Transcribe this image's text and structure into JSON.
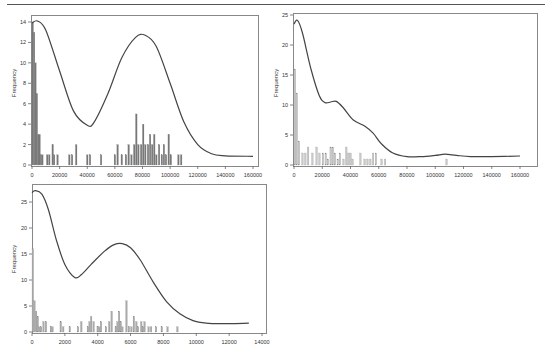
{
  "chart_data": [
    {
      "type": "bar",
      "overlay": "density-line",
      "title": "",
      "xlabel": "",
      "ylabel": "Frequency",
      "xlim": [
        0,
        160000
      ],
      "ylim": [
        0,
        14
      ],
      "xticks": [
        "0",
        "20000",
        "40000",
        "60000",
        "80000",
        "100000",
        "120000",
        "140000",
        "160000"
      ],
      "yticks": [
        "0",
        "2",
        "4",
        "6",
        "8",
        "10",
        "12",
        "14"
      ],
      "bar_color": "#777777",
      "bins": [
        {
          "x": 500,
          "h": 14
        },
        {
          "x": 1500,
          "h": 13
        },
        {
          "x": 2500,
          "h": 10
        },
        {
          "x": 3500,
          "h": 7
        },
        {
          "x": 4500,
          "h": 3
        },
        {
          "x": 5500,
          "h": 3
        },
        {
          "x": 6500,
          "h": 1
        },
        {
          "x": 7500,
          "h": 1
        },
        {
          "x": 11000,
          "h": 1
        },
        {
          "x": 12500,
          "h": 1
        },
        {
          "x": 15000,
          "h": 2
        },
        {
          "x": 16000,
          "h": 1
        },
        {
          "x": 18500,
          "h": 1
        },
        {
          "x": 27000,
          "h": 1
        },
        {
          "x": 29000,
          "h": 1
        },
        {
          "x": 32000,
          "h": 2
        },
        {
          "x": 40000,
          "h": 1
        },
        {
          "x": 42000,
          "h": 1
        },
        {
          "x": 50000,
          "h": 1
        },
        {
          "x": 60000,
          "h": 1
        },
        {
          "x": 62000,
          "h": 2
        },
        {
          "x": 65000,
          "h": 1
        },
        {
          "x": 68000,
          "h": 1
        },
        {
          "x": 70000,
          "h": 2
        },
        {
          "x": 72000,
          "h": 1
        },
        {
          "x": 74000,
          "h": 2
        },
        {
          "x": 75500,
          "h": 5
        },
        {
          "x": 77000,
          "h": 2
        },
        {
          "x": 79000,
          "h": 2
        },
        {
          "x": 80500,
          "h": 4
        },
        {
          "x": 82000,
          "h": 2
        },
        {
          "x": 84000,
          "h": 2
        },
        {
          "x": 85500,
          "h": 3
        },
        {
          "x": 87000,
          "h": 2
        },
        {
          "x": 88500,
          "h": 3
        },
        {
          "x": 90000,
          "h": 1
        },
        {
          "x": 92000,
          "h": 2
        },
        {
          "x": 94000,
          "h": 1
        },
        {
          "x": 95500,
          "h": 2
        },
        {
          "x": 97000,
          "h": 1
        },
        {
          "x": 99000,
          "h": 3
        },
        {
          "x": 100500,
          "h": 1
        },
        {
          "x": 106000,
          "h": 1
        },
        {
          "x": 108000,
          "h": 1
        }
      ],
      "curve": [
        [
          0,
          13.9
        ],
        [
          4000,
          14.1
        ],
        [
          10000,
          13.2
        ],
        [
          20000,
          9.2
        ],
        [
          30000,
          5.3
        ],
        [
          40000,
          3.9
        ],
        [
          45000,
          4.2
        ],
        [
          55000,
          7.0
        ],
        [
          65000,
          10.5
        ],
        [
          75000,
          12.5
        ],
        [
          82000,
          12.7
        ],
        [
          90000,
          11.6
        ],
        [
          100000,
          8.0
        ],
        [
          110000,
          4.2
        ],
        [
          120000,
          2.0
        ],
        [
          130000,
          1.1
        ],
        [
          140000,
          0.9
        ],
        [
          160000,
          0.85
        ]
      ]
    },
    {
      "type": "bar",
      "overlay": "density-line",
      "title": "",
      "xlabel": "",
      "ylabel": "Frequency",
      "xlim": [
        0,
        160000
      ],
      "ylim": [
        0,
        25
      ],
      "xticks": [
        "0",
        "20000",
        "40000",
        "60000",
        "80000",
        "100000",
        "120000",
        "140000",
        "160000"
      ],
      "yticks": [
        "0",
        "5",
        "10",
        "15",
        "20",
        "25"
      ],
      "bar_color": "#c8c8c8",
      "bins": [
        {
          "x": 700,
          "h": 16
        },
        {
          "x": 2000,
          "h": 12
        },
        {
          "x": 3500,
          "h": 4
        },
        {
          "x": 6000,
          "h": 2
        },
        {
          "x": 8000,
          "h": 2
        },
        {
          "x": 10000,
          "h": 3
        },
        {
          "x": 13000,
          "h": 2
        },
        {
          "x": 16000,
          "h": 3
        },
        {
          "x": 18000,
          "h": 2
        },
        {
          "x": 20500,
          "h": 2
        },
        {
          "x": 22500,
          "h": 2
        },
        {
          "x": 24000,
          "h": 1
        },
        {
          "x": 26000,
          "h": 3
        },
        {
          "x": 27500,
          "h": 3
        },
        {
          "x": 29000,
          "h": 2
        },
        {
          "x": 31000,
          "h": 1
        },
        {
          "x": 32500,
          "h": 2
        },
        {
          "x": 35000,
          "h": 1
        },
        {
          "x": 37000,
          "h": 3
        },
        {
          "x": 38500,
          "h": 2
        },
        {
          "x": 40000,
          "h": 2
        },
        {
          "x": 41500,
          "h": 1
        },
        {
          "x": 47000,
          "h": 2
        },
        {
          "x": 50000,
          "h": 1
        },
        {
          "x": 52000,
          "h": 1
        },
        {
          "x": 54000,
          "h": 1
        },
        {
          "x": 56000,
          "h": 2
        },
        {
          "x": 58000,
          "h": 2
        },
        {
          "x": 62000,
          "h": 1
        },
        {
          "x": 64500,
          "h": 1
        },
        {
          "x": 108000,
          "h": 1
        }
      ],
      "curve": [
        [
          0,
          23.5
        ],
        [
          2500,
          24.1
        ],
        [
          6000,
          22.0
        ],
        [
          12000,
          16.0
        ],
        [
          18000,
          11.5
        ],
        [
          22000,
          10.4
        ],
        [
          26000,
          10.5
        ],
        [
          30000,
          10.6
        ],
        [
          35000,
          9.5
        ],
        [
          42000,
          7.5
        ],
        [
          50000,
          6.5
        ],
        [
          56000,
          5.3
        ],
        [
          62000,
          3.5
        ],
        [
          70000,
          2.0
        ],
        [
          80000,
          1.4
        ],
        [
          90000,
          1.4
        ],
        [
          100000,
          1.6
        ],
        [
          107000,
          1.8
        ],
        [
          115000,
          1.6
        ],
        [
          125000,
          1.4
        ],
        [
          140000,
          1.4
        ],
        [
          160000,
          1.5
        ]
      ]
    },
    {
      "type": "bar",
      "overlay": "density-line",
      "title": "",
      "xlabel": "",
      "ylabel": "Frequency",
      "xlim": [
        0,
        14000
      ],
      "ylim": [
        0,
        27
      ],
      "xticks": [
        "0",
        "2000",
        "4000",
        "6000",
        "8000",
        "10000",
        "12000",
        "14000"
      ],
      "yticks": [
        "0",
        "5",
        "10",
        "15",
        "20",
        "25"
      ],
      "bar_color": "#aaaaaa",
      "bins": [
        {
          "x": 50,
          "h": 16
        },
        {
          "x": 150,
          "h": 6
        },
        {
          "x": 250,
          "h": 4
        },
        {
          "x": 350,
          "h": 3
        },
        {
          "x": 450,
          "h": 1
        },
        {
          "x": 550,
          "h": 1
        },
        {
          "x": 700,
          "h": 2
        },
        {
          "x": 850,
          "h": 2
        },
        {
          "x": 1150,
          "h": 1
        },
        {
          "x": 1250,
          "h": 1
        },
        {
          "x": 1750,
          "h": 2
        },
        {
          "x": 1900,
          "h": 1
        },
        {
          "x": 2300,
          "h": 1
        },
        {
          "x": 2800,
          "h": 1
        },
        {
          "x": 3000,
          "h": 2
        },
        {
          "x": 3400,
          "h": 1
        },
        {
          "x": 3500,
          "h": 2
        },
        {
          "x": 3600,
          "h": 3
        },
        {
          "x": 3750,
          "h": 2
        },
        {
          "x": 4000,
          "h": 1
        },
        {
          "x": 4100,
          "h": 1
        },
        {
          "x": 4200,
          "h": 2
        },
        {
          "x": 4500,
          "h": 1
        },
        {
          "x": 4700,
          "h": 2
        },
        {
          "x": 4850,
          "h": 4
        },
        {
          "x": 5100,
          "h": 1
        },
        {
          "x": 5200,
          "h": 2
        },
        {
          "x": 5300,
          "h": 4
        },
        {
          "x": 5400,
          "h": 2
        },
        {
          "x": 5500,
          "h": 1
        },
        {
          "x": 5750,
          "h": 6
        },
        {
          "x": 5900,
          "h": 1
        },
        {
          "x": 6050,
          "h": 1
        },
        {
          "x": 6200,
          "h": 3
        },
        {
          "x": 6350,
          "h": 2
        },
        {
          "x": 6450,
          "h": 1
        },
        {
          "x": 6650,
          "h": 2
        },
        {
          "x": 6750,
          "h": 1
        },
        {
          "x": 6850,
          "h": 2
        },
        {
          "x": 7100,
          "h": 1
        },
        {
          "x": 7250,
          "h": 1
        },
        {
          "x": 7550,
          "h": 1
        },
        {
          "x": 7900,
          "h": 1
        },
        {
          "x": 8250,
          "h": 1
        },
        {
          "x": 8850,
          "h": 1
        }
      ],
      "curve": [
        [
          0,
          26.8
        ],
        [
          200,
          27.2
        ],
        [
          600,
          26.5
        ],
        [
          1000,
          23.5
        ],
        [
          1500,
          17.5
        ],
        [
          2000,
          13.0
        ],
        [
          2600,
          10.5
        ],
        [
          3000,
          11.0
        ],
        [
          3600,
          13.0
        ],
        [
          4400,
          15.5
        ],
        [
          5000,
          16.8
        ],
        [
          5500,
          17.0
        ],
        [
          6000,
          16.2
        ],
        [
          6600,
          13.8
        ],
        [
          7400,
          9.5
        ],
        [
          8200,
          5.8
        ],
        [
          9000,
          3.5
        ],
        [
          9800,
          2.2
        ],
        [
          10600,
          1.7
        ],
        [
          11500,
          1.6
        ],
        [
          13200,
          1.7
        ]
      ]
    }
  ],
  "charts": [
    {
      "ylabel": "Frequency",
      "xticks": [
        "0",
        "20000",
        "40000",
        "60000",
        "80000",
        "100000",
        "120000",
        "140000",
        "160000"
      ],
      "yticks": [
        "0",
        "2",
        "4",
        "6",
        "8",
        "10",
        "12",
        "14"
      ]
    },
    {
      "ylabel": "Frequency",
      "xticks": [
        "0",
        "20000",
        "40000",
        "60000",
        "80000",
        "100000",
        "120000",
        "140000",
        "160000"
      ],
      "yticks": [
        "0",
        "5",
        "10",
        "15",
        "20",
        "25"
      ]
    },
    {
      "ylabel": "Frequency",
      "xticks": [
        "0",
        "2000",
        "4000",
        "6000",
        "8000",
        "10000",
        "12000",
        "14000"
      ],
      "yticks": [
        "0",
        "5",
        "10",
        "15",
        "20",
        "25"
      ]
    }
  ]
}
